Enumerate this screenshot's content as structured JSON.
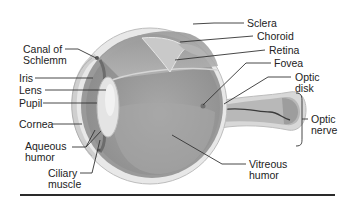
{
  "diagram": {
    "type": "anatomical-diagram",
    "labels_left": [
      {
        "id": "canal-of-schlemm",
        "text": "Canal of\nSchlemm"
      },
      {
        "id": "iris",
        "text": "Iris"
      },
      {
        "id": "lens",
        "text": "Lens"
      },
      {
        "id": "pupil",
        "text": "Pupil"
      },
      {
        "id": "cornea",
        "text": "Cornea"
      },
      {
        "id": "aqueous-humor",
        "text": "Aqueous\nhumor"
      },
      {
        "id": "ciliary-muscle",
        "text": "Ciliary\nmuscle"
      }
    ],
    "labels_right": [
      {
        "id": "sclera",
        "text": "Sclera"
      },
      {
        "id": "choroid",
        "text": "Choroid"
      },
      {
        "id": "retina",
        "text": "Retina"
      },
      {
        "id": "fovea",
        "text": "Fovea"
      },
      {
        "id": "optic-disk",
        "text": "Optic\ndisk"
      },
      {
        "id": "optic-nerve",
        "text": "Optic\nnerve"
      },
      {
        "id": "vitreous-humor",
        "text": "Vitreous\nhumor"
      }
    ]
  }
}
